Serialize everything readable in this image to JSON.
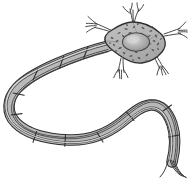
{
  "figure": {
    "name": "neuron-diagram",
    "background_color": "#ffffff",
    "canvas": {
      "width": 188,
      "height": 182
    },
    "style": {
      "outline_color": "#2b2b2b",
      "soma_fill": "#b4b4b4",
      "soma_fill_light": "#c8c8c8",
      "nucleus_fill": "#a0a0a0",
      "nucleus_highlight": "#d2d2d2",
      "nissl_fill": "#555555",
      "myelin_fill": "#9a9a9a",
      "myelin_fill_light": "#cccccc",
      "axon_line_color": "#3a3a3a",
      "dendrite_line_color": "#4a4a4a"
    }
  },
  "parts": {
    "soma": {
      "label": "cell body (soma)",
      "shape": "star-pentagon",
      "center": [
        140,
        42
      ],
      "fill": "#b4b4b4"
    },
    "nucleus": {
      "label": "nucleus",
      "shape": "ellipse",
      "center": [
        136,
        42
      ],
      "rx": 13,
      "ry": 9,
      "fill": "#a0a0a0"
    },
    "nissl_bodies": {
      "label": "Nissl bodies / cytoplasm specks",
      "count": 34,
      "fill": "#555555"
    },
    "dendrites": {
      "label": "dendrites",
      "count": 5,
      "items": [
        {
          "name": "dendrite-top",
          "direction": "up",
          "branch_tips": 4
        },
        {
          "name": "dendrite-upper-left",
          "direction": "upper-left",
          "branch_tips": 3
        },
        {
          "name": "dendrite-right",
          "direction": "right",
          "branch_tips": 3
        },
        {
          "name": "dendrite-lower-left",
          "direction": "down-left",
          "branch_tips": 3
        },
        {
          "name": "dendrite-lower-right",
          "direction": "down-right",
          "branch_tips": 3
        }
      ]
    },
    "axon": {
      "label": "axon with myelin sheath",
      "path_shape": "long U-turn from soma leftward, around, then rightward and down",
      "stripe_count": 5,
      "myelin_segments": 9,
      "nodes_of_ranvier": 8
    },
    "axon_terminal": {
      "label": "axon terminals",
      "branch_count": 4,
      "location": "bottom-right"
    }
  },
  "annotations": {
    "visible_text": []
  }
}
